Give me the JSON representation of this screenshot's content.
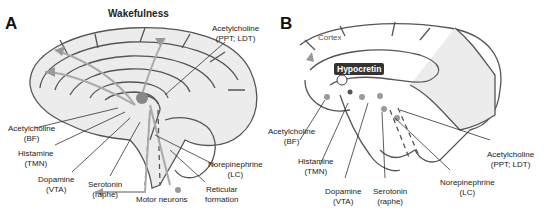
{
  "panel_a": {
    "letter": "A",
    "title": "Wakefulness",
    "labels": {
      "ach_ppt": [
        "Acetylcholine",
        "(PPT; LDT)"
      ],
      "ach_bf": [
        "Acetylcholine",
        "(BF)"
      ],
      "histamine": [
        "Histamine",
        "(TMN)"
      ],
      "dopamine": [
        "Dopamine",
        "(VTA)"
      ],
      "serotonin": [
        "Serotonin",
        "(raphe)"
      ],
      "motor": "Motor neurons",
      "reticular": [
        "Reticular",
        "formation"
      ],
      "norepinephrine": [
        "Norepinephrine",
        "(LC)"
      ]
    }
  },
  "panel_b": {
    "letter": "B",
    "cortex": "Cortex",
    "hypocretin": "Hypocretin",
    "labels": {
      "ach_bf": [
        "Acetylcholine",
        "(BF)"
      ],
      "histamine": [
        "Histamine",
        "(TMN)"
      ],
      "dopamine": [
        "Dopamine",
        "(VTA)"
      ],
      "serotonin": [
        "Serotonin",
        "(raphe)"
      ],
      "norepinephrine": [
        "Norepinephrine",
        "(LC)"
      ],
      "ach_ppt": [
        "Acetylcholine",
        "(PPT; LDT)"
      ]
    }
  },
  "colors": {
    "outline": "#444444",
    "pathway": "#999999",
    "fill": "#e6e6e6",
    "hypocretin_bg": "#333333"
  }
}
